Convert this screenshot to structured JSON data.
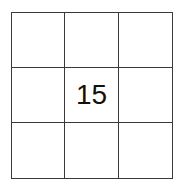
{
  "grid": {
    "rows": 3,
    "cols": 3,
    "cells": [
      "",
      "",
      "",
      "",
      "15",
      "",
      "",
      "",
      ""
    ]
  }
}
